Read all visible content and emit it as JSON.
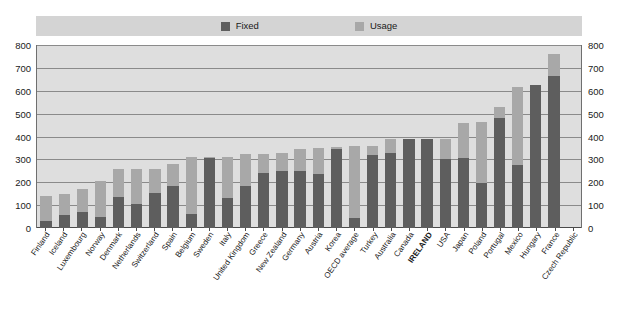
{
  "legend": {
    "items": [
      {
        "label": "Fixed",
        "color": "#5e5e5e",
        "icon": "square-swatch-icon"
      },
      {
        "label": "Usage",
        "color": "#a8a8a8",
        "icon": "square-swatch-icon"
      }
    ]
  },
  "axis": {
    "y_ticks": [
      "0",
      "100",
      "200",
      "300",
      "400",
      "500",
      "600",
      "700",
      "800"
    ],
    "y_min": 0,
    "y_max": 800,
    "y_step": 100
  },
  "chart_data": {
    "type": "bar",
    "stacked": true,
    "title": "",
    "subtitle": "",
    "xlabel": "",
    "ylabel": "",
    "ylim": [
      0,
      800
    ],
    "grid": true,
    "legend_position": "top",
    "highlight_category": "IRELAND",
    "categories": [
      "Finland",
      "Iceland",
      "Luxembourg",
      "Norway",
      "Denmark",
      "Netherlands",
      "Switzerland",
      "Spain",
      "Belgium",
      "Sweden",
      "Italy",
      "United Kingdom",
      "Greece",
      "New Zealand",
      "Germany",
      "Austria",
      "Korea",
      "OECD average",
      "Turkey",
      "Australia",
      "Canada",
      "IRELAND",
      "USA",
      "Japan",
      "Poland",
      "Portugal",
      "Mexico",
      "Hungary",
      "France",
      "Czech Republic"
    ],
    "series": [
      {
        "name": "Fixed",
        "color": "#5e5e5e",
        "values": [
          30,
          55,
          70,
          50,
          135,
          105,
          155,
          185,
          60,
          305,
          130,
          185,
          240,
          250,
          250,
          235,
          345,
          45,
          320,
          330,
          390,
          390,
          300,
          305,
          195,
          480,
          275,
          625,
          665,
          0
        ]
      },
      {
        "name": "Usage",
        "color": "#a8a8a8",
        "values": [
          110,
          95,
          100,
          155,
          125,
          155,
          105,
          95,
          250,
          5,
          180,
          140,
          85,
          80,
          95,
          115,
          10,
          315,
          40,
          60,
          0,
          0,
          90,
          155,
          270,
          50,
          340,
          0,
          95,
          0
        ]
      }
    ],
    "totals": [
      140,
      150,
      170,
      205,
      260,
      260,
      260,
      280,
      310,
      310,
      310,
      325,
      325,
      330,
      345,
      350,
      355,
      360,
      360,
      390,
      390,
      390,
      390,
      460,
      465,
      530,
      615,
      625,
      760,
      0
    ],
    "note": "Values are stacked: Fixed (lower, dark) + Usage (upper, light)."
  }
}
